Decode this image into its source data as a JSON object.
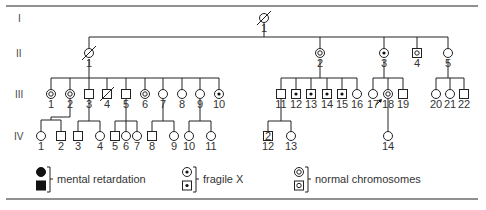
{
  "generations": [
    "I",
    "II",
    "III",
    "IV"
  ],
  "individuals": {
    "I": [
      {
        "id": "1",
        "sex": "female",
        "status": "deceased"
      }
    ],
    "II": [
      {
        "id": "1",
        "sex": "female",
        "status": "deceased"
      },
      {
        "id": "2",
        "sex": "female",
        "status": "normal-chromosomes"
      },
      {
        "id": "3",
        "sex": "female",
        "status": "fragile-x"
      },
      {
        "id": "4",
        "sex": "male",
        "status": "normal-chromosomes"
      },
      {
        "id": "5",
        "sex": "female",
        "status": "unaffected"
      }
    ],
    "III": [
      {
        "id": "1",
        "sex": "female",
        "status": "normal-chromosomes"
      },
      {
        "id": "2",
        "sex": "female",
        "status": "normal-chromosomes"
      },
      {
        "id": "3",
        "sex": "male",
        "status": "unaffected"
      },
      {
        "id": "4",
        "sex": "male",
        "status": "deceased"
      },
      {
        "id": "5",
        "sex": "male",
        "status": "unaffected"
      },
      {
        "id": "6",
        "sex": "female",
        "status": "normal-chromosomes"
      },
      {
        "id": "7",
        "sex": "female",
        "status": "unaffected"
      },
      {
        "id": "8",
        "sex": "female",
        "status": "mental-retardation"
      },
      {
        "id": "9",
        "sex": "female",
        "status": "unaffected"
      },
      {
        "id": "10",
        "sex": "female",
        "status": "fragile-x"
      },
      {
        "id": "11",
        "sex": "male",
        "status": "unaffected"
      },
      {
        "id": "12",
        "sex": "male",
        "status": "fragile-x"
      },
      {
        "id": "13",
        "sex": "male",
        "status": "fragile-x"
      },
      {
        "id": "14",
        "sex": "male",
        "status": "fragile-x"
      },
      {
        "id": "15",
        "sex": "male",
        "status": "fragile-x"
      },
      {
        "id": "16",
        "sex": "female",
        "status": "unaffected"
      },
      {
        "id": "17",
        "sex": "female",
        "status": "mental-retardation",
        "proband": true
      },
      {
        "id": "18",
        "sex": "female",
        "status": "normal-chromosomes"
      },
      {
        "id": "19",
        "sex": "male",
        "status": "unaffected"
      },
      {
        "id": "20",
        "sex": "female",
        "status": "unaffected"
      },
      {
        "id": "21",
        "sex": "female",
        "status": "mental-retardation"
      },
      {
        "id": "22",
        "sex": "male",
        "status": "unaffected"
      }
    ],
    "IV": [
      {
        "id": "1",
        "sex": "female",
        "status": "unaffected"
      },
      {
        "id": "2",
        "sex": "male",
        "status": "unaffected"
      },
      {
        "id": "3",
        "sex": "male",
        "status": "unaffected"
      },
      {
        "id": "4",
        "sex": "female",
        "status": "unaffected"
      },
      {
        "id": "5",
        "sex": "male",
        "status": "unaffected"
      },
      {
        "id": "6",
        "sex": "female",
        "status": "unaffected"
      },
      {
        "id": "7",
        "sex": "female",
        "status": "unaffected"
      },
      {
        "id": "8",
        "sex": "male",
        "status": "unaffected"
      },
      {
        "id": "9",
        "sex": "female",
        "status": "unaffected"
      },
      {
        "id": "10",
        "sex": "female",
        "status": "unaffected"
      },
      {
        "id": "11",
        "sex": "female",
        "status": "unaffected"
      },
      {
        "id": "12",
        "sex": "male",
        "status": "unaffected",
        "count": "2"
      },
      {
        "id": "13",
        "sex": "female",
        "status": "unaffected"
      },
      {
        "id": "14",
        "sex": "female",
        "status": "unaffected"
      }
    ]
  },
  "legend": [
    {
      "key": "mental-retardation",
      "label": "mental retardation"
    },
    {
      "key": "fragile-x",
      "label": "fragile X"
    },
    {
      "key": "normal-chromosomes",
      "label": "normal chromosomes"
    }
  ]
}
